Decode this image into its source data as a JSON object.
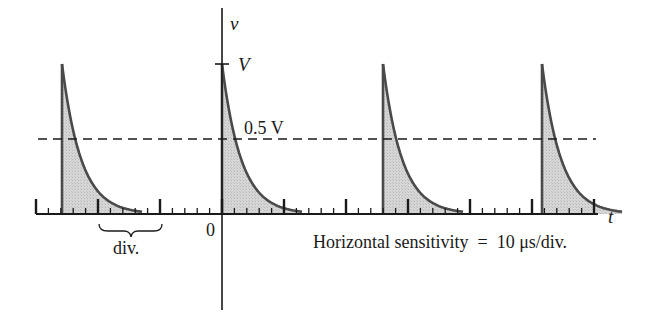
{
  "figure": {
    "labels": {
      "v_axis": "v",
      "t_axis": "t",
      "peak": "V",
      "half": "0.5 V",
      "origin": "0",
      "division": "div.",
      "sensitivity": "Horizontal sensitivity  =  10 μs/div."
    },
    "colors": {
      "line": "#1a1a1a",
      "curve": "#4a4a4a",
      "fill": "#d4d4d4",
      "background": "#ffffff"
    },
    "geometry": {
      "baseline_y": 214,
      "peak_y": 64,
      "half_y": 139,
      "v_axis_x": 222,
      "axis_start_x": 36,
      "axis_end_x": 598,
      "division_px": 62,
      "minor_per_div": 5,
      "pulse_starts_x": [
        62,
        222,
        383,
        542
      ],
      "decay_width_px": 80
    },
    "horizontal_sensitivity_us_per_div": 10,
    "pulse_period_div": 2.6,
    "dashed_line": {
      "x1": 38,
      "x2": 596
    }
  }
}
